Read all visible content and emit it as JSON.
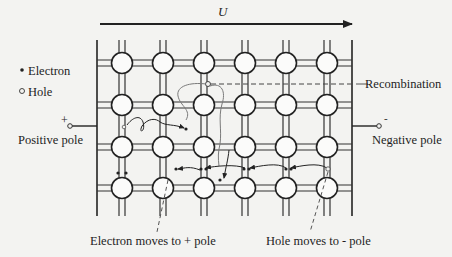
{
  "diagram": {
    "voltage": {
      "label": "U",
      "direction": "left-to-right"
    },
    "legend": [
      {
        "symbol": "filled-dot",
        "glyph": "•",
        "label": "Electron"
      },
      {
        "symbol": "open-circle",
        "glyph": "○",
        "label": "Hole"
      }
    ],
    "poles": {
      "positive": {
        "sign": "+",
        "label": "Positive pole"
      },
      "negative": {
        "sign": "-",
        "label": "Negative pole"
      }
    },
    "annotations": {
      "recombination": "Recombination",
      "electron_moves": "Electron moves to + pole",
      "hole_moves": "Hole moves to - pole"
    },
    "lattice": {
      "rows": 4,
      "columns": 6,
      "atom_shape": "circle",
      "bond_style": "double-line"
    },
    "colors": {
      "background": "#f3f3f1",
      "ink": "#222222",
      "path_gray": "#777777",
      "atom_fill": "#fbfbfa"
    }
  }
}
